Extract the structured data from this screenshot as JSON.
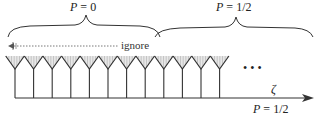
{
  "diagram": {
    "top_labels": [
      {
        "id": "left-region",
        "var": "P",
        "eq": " = ",
        "value": "0"
      },
      {
        "id": "right-region",
        "var": "P",
        "eq": " = ",
        "value": "1/2"
      }
    ],
    "ignore_label": "ignore",
    "axis_label": "ζ",
    "bottom_label": {
      "var": "P",
      "eq": " = ",
      "value": "1/2"
    },
    "ellipsis": "• • •",
    "v_count": 12,
    "v_spacing": 18.6,
    "v_start_x": 15,
    "colors": {
      "line": "#333333",
      "hatch": "#888888",
      "dotted": "#555555"
    }
  }
}
